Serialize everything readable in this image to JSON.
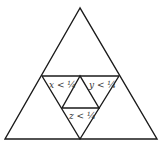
{
  "diagram": {
    "type": "nested-triangle-subdivision",
    "labels": {
      "x": "x < ¼",
      "y": "y < ¼",
      "z": "z < ¼"
    },
    "colors": {
      "stroke": "#1a1a1a",
      "label": "#333333",
      "background": "#ffffff"
    }
  }
}
